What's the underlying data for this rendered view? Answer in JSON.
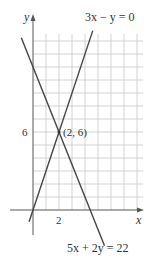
{
  "chart_data": {
    "type": "line",
    "title": "",
    "xlabel": "x",
    "ylabel": "y",
    "xlim": [
      -0.5,
      8.5
    ],
    "ylim": [
      -2.5,
      15.5
    ],
    "grid": true,
    "x_tick_labels": [
      "2"
    ],
    "y_tick_labels": [
      "6"
    ],
    "series": [
      {
        "name": "3x − y = 0",
        "equation": "y = 3x",
        "points": [
          [
            -0.3,
            -0.9
          ],
          [
            4.6,
            13.8
          ]
        ]
      },
      {
        "name": "5x + 2y = 22",
        "equation": "y = (22 − 5x)/2",
        "points": [
          [
            -0.9,
            13.25
          ],
          [
            5.5,
            -2.75
          ]
        ]
      }
    ],
    "annotations": [
      {
        "text": "(2, 6)",
        "x": 2,
        "y": 6
      }
    ]
  },
  "labels": {
    "y_axis": "y",
    "x_axis": "x",
    "line1": "3x − y = 0",
    "line2": "5x + 2y = 22",
    "point": "(2, 6)",
    "xtick": "2",
    "ytick": "6"
  }
}
